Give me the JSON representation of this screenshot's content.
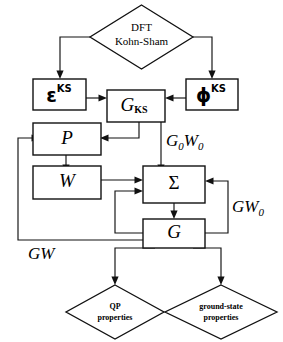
{
  "diagram": {
    "background_color": "#ffffff",
    "line_color": "#111111",
    "text_color": "#000000",
    "nodes": {
      "dft": {
        "line1": "DFT",
        "line2": "Kohn-Sham",
        "shape": "diamond"
      },
      "epsilon_ks": {
        "base": "ε",
        "sup": "KS",
        "shape": "rect"
      },
      "phi_ks": {
        "base": "ϕ",
        "sup": "KS",
        "shape": "rect"
      },
      "g_ks": {
        "base": "G",
        "sub": "KS",
        "shape": "rect"
      },
      "p": {
        "base": "P",
        "shape": "rect"
      },
      "w": {
        "base": "W",
        "shape": "rect"
      },
      "sigma": {
        "base": "Σ",
        "shape": "rect"
      },
      "g": {
        "base": "G",
        "shape": "rect"
      },
      "qp": {
        "line1": "QP",
        "line2": "properties",
        "shape": "diamond"
      },
      "ground_state": {
        "line1": "ground-state",
        "line2": "properties",
        "shape": "diamond"
      }
    },
    "edge_labels": {
      "g0w0": {
        "g": "G",
        "g_sub": "0",
        "w": "W",
        "w_sub": "0"
      },
      "gw0": {
        "g": "G",
        "w": "W",
        "w_sub": "0"
      },
      "gw": {
        "text": "GW"
      }
    }
  }
}
